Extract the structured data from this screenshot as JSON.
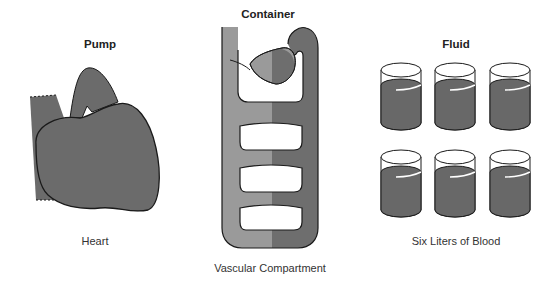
{
  "panels": {
    "pump": {
      "title": "Pump",
      "caption": "Heart"
    },
    "container": {
      "title": "Container",
      "caption": "Vascular Compartment"
    },
    "fluid": {
      "title": "Fluid",
      "caption": "Six Liters of Blood",
      "beaker_count": 6
    }
  },
  "colors": {
    "heart_fill": "#6b6b6b",
    "vessel_light": "#9a9a9a",
    "vessel_dark": "#6e6e6e",
    "blood": "#686868",
    "outline": "#1a1a1a"
  }
}
